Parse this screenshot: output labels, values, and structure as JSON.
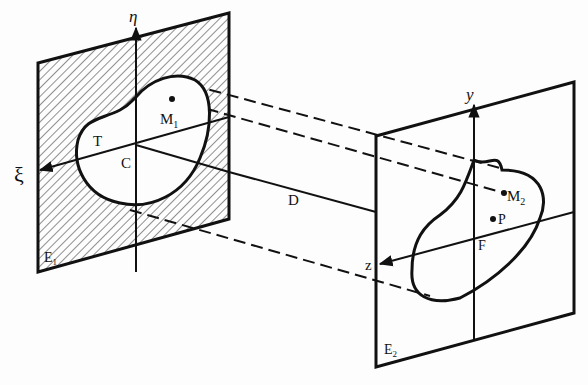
{
  "diagram": {
    "planes": [
      {
        "id": "E1",
        "label": "E",
        "sub": "1",
        "hatched": true
      },
      {
        "id": "E2",
        "label": "E",
        "sub": "2",
        "hatched": false
      }
    ],
    "axes": {
      "eta": "η",
      "xi": "ξ",
      "y": "y",
      "z": "z"
    },
    "points": {
      "T": "T",
      "C": "C",
      "M1": {
        "label": "M",
        "sub": "1"
      },
      "M2": {
        "label": "M",
        "sub": "2"
      },
      "P": "P",
      "F": "F"
    },
    "distance_label": "D",
    "colors": {
      "ink": "#111111",
      "paper": "#fdfdfd"
    }
  }
}
